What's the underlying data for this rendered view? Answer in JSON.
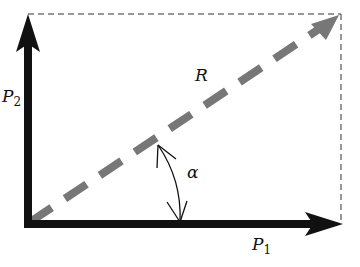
{
  "diagram": {
    "type": "vector-parallelogram",
    "vectors": [
      {
        "id": "P1",
        "label": "P",
        "subscript": "1",
        "direction": "horizontal",
        "style": "solid-black"
      },
      {
        "id": "P2",
        "label": "P",
        "subscript": "2",
        "direction": "vertical",
        "style": "solid-black"
      },
      {
        "id": "R",
        "label": "R",
        "direction": "diagonal",
        "style": "dashed-gray"
      }
    ],
    "angle": {
      "label": "α",
      "between": [
        "P1",
        "R"
      ]
    },
    "colors": {
      "force": "#111111",
      "resultant": "#777777",
      "guide": "#333333"
    }
  }
}
